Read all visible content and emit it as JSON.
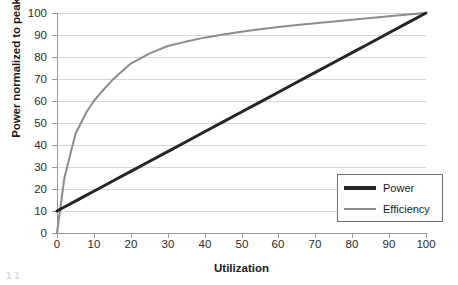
{
  "chart_data": {
    "type": "line",
    "title": "",
    "xlabel": "Utilization",
    "ylabel": "Power normalized to peak",
    "xlim": [
      0,
      100
    ],
    "ylim": [
      0,
      100
    ],
    "xticks": [
      0,
      10,
      20,
      30,
      40,
      50,
      60,
      70,
      80,
      90,
      100
    ],
    "yticks": [
      0,
      10,
      20,
      30,
      40,
      50,
      60,
      70,
      80,
      90,
      100
    ],
    "grid": "horizontal",
    "legend_position": "lower-right-inside",
    "x": [
      0,
      2,
      5,
      8,
      10,
      12,
      15,
      20,
      25,
      30,
      35,
      40,
      45,
      50,
      55,
      60,
      65,
      70,
      75,
      80,
      85,
      90,
      95,
      100
    ],
    "series": [
      {
        "name": "Power",
        "color": "#262626",
        "width": 3,
        "values": [
          10,
          11.8,
          14.5,
          17.2,
          19,
          20.8,
          23.5,
          28,
          32.5,
          37,
          41.5,
          46,
          50.5,
          55,
          59.5,
          64,
          68.5,
          73,
          77.5,
          82,
          86.5,
          91,
          95.5,
          100
        ]
      },
      {
        "name": "Efficiency",
        "color": "#8c8c8c",
        "width": 2,
        "values": [
          0,
          25,
          45,
          55,
          60,
          64,
          69.5,
          77,
          81.5,
          85,
          87,
          88.8,
          90.2,
          91.5,
          92.6,
          93.6,
          94.5,
          95.3,
          96.1,
          96.9,
          97.7,
          98.5,
          99.3,
          100
        ]
      }
    ],
    "legend": [
      {
        "label": "Power",
        "color": "#262626"
      },
      {
        "label": "Efficiency",
        "color": "#8c8c8c"
      }
    ]
  },
  "axes": {
    "y_title": "Power normalized to peak",
    "x_title": "Utilization",
    "y_tick_labels": [
      "0",
      "10",
      "20",
      "30",
      "40",
      "50",
      "60",
      "70",
      "80",
      "90",
      "100"
    ],
    "x_tick_labels": [
      "0",
      "10",
      "20",
      "30",
      "40",
      "50",
      "60",
      "70",
      "80",
      "90",
      "100"
    ]
  },
  "legend": {
    "items": [
      {
        "label": "Power"
      },
      {
        "label": "Efficiency"
      }
    ]
  },
  "footer": {
    "artifact_text": "1 1"
  }
}
